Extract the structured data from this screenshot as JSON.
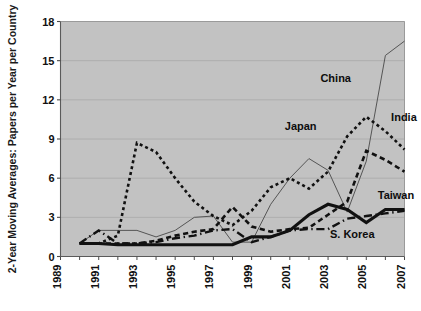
{
  "chart_data": {
    "type": "line",
    "title": "",
    "xlabel": "",
    "ylabel": "2-Year Moving Averages: Papers per Year per Country",
    "xlim": [
      1989,
      2007
    ],
    "ylim": [
      0,
      18
    ],
    "yticks": [
      0,
      3,
      6,
      9,
      12,
      15,
      18
    ],
    "xticks": [
      1989,
      1991,
      1993,
      1995,
      1997,
      1999,
      2001,
      2003,
      2005,
      2007
    ],
    "xtick_labels": [
      "1989",
      "1991",
      "1993",
      "1995",
      "1997",
      "1999",
      "2001",
      "2003",
      "2005",
      "2007"
    ],
    "ytick_labels": [
      "0",
      "3",
      "6",
      "9",
      "12",
      "15",
      "18"
    ],
    "grid": true,
    "grid_axis": "y",
    "legend": "inline-labels",
    "plot_bgcolor": "#c2c2c2",
    "figure_bgcolor": "#ffffff",
    "x": [
      1990,
      1991,
      1992,
      1993,
      1994,
      1995,
      1996,
      1997,
      1998,
      1999,
      2000,
      2001,
      2002,
      2003,
      2004,
      2005,
      2006,
      2007
    ],
    "series": [
      {
        "name": "China",
        "style": "thin-solid",
        "color": "#555555",
        "width": 1,
        "label_x": 2004.2,
        "label_y": 13.4,
        "values": [
          1.0,
          2.0,
          2.0,
          2.0,
          1.5,
          2.0,
          3.0,
          3.1,
          1.1,
          1.1,
          4.0,
          6.0,
          7.5,
          6.6,
          3.4,
          7.3,
          15.4,
          16.5
        ]
      },
      {
        "name": "India",
        "style": "dotted",
        "color": "#111111",
        "width": 2.6,
        "label_x": 2006.3,
        "label_y": 10.4,
        "values": [
          1.0,
          1.0,
          1.6,
          8.7,
          8.0,
          6.0,
          4.2,
          3.1,
          2.4,
          3.5,
          5.3,
          6.0,
          5.2,
          6.5,
          9.2,
          10.7,
          9.6,
          8.2
        ]
      },
      {
        "name": "Japan",
        "style": "thick-dashed",
        "color": "#111111",
        "width": 2.6,
        "label_x": 2002.4,
        "label_y": 9.7,
        "values": [
          1.0,
          1.0,
          1.0,
          1.0,
          1.2,
          1.6,
          1.9,
          2.1,
          3.8,
          2.3,
          1.9,
          2.1,
          2.2,
          3.2,
          4.2,
          8.1,
          7.4,
          6.5
        ]
      },
      {
        "name": "Taiwan",
        "style": "thick-solid",
        "color": "#111111",
        "width": 3.1,
        "label_x": 2005.6,
        "label_y": 4.4,
        "values": [
          1.0,
          1.0,
          0.9,
          0.9,
          0.9,
          0.9,
          0.9,
          0.9,
          0.9,
          1.5,
          1.5,
          2.0,
          3.2,
          4.0,
          3.6,
          2.6,
          3.6,
          3.6
        ]
      },
      {
        "name": "S. Korea",
        "style": "dash-dot",
        "color": "#111111",
        "width": 2.4,
        "label_x": 2003.1,
        "label_y": 1.45,
        "values": [
          1.0,
          2.0,
          1.0,
          1.0,
          1.1,
          1.4,
          1.6,
          2.0,
          2.1,
          1.1,
          1.5,
          2.0,
          2.1,
          2.1,
          2.9,
          3.1,
          3.3,
          3.5
        ]
      }
    ],
    "series_label_anchors": [
      {
        "name": "China",
        "anchor": "end"
      },
      {
        "name": "India",
        "anchor": "start"
      },
      {
        "name": "Japan",
        "anchor": "end"
      },
      {
        "name": "Taiwan",
        "anchor": "start"
      },
      {
        "name": "S. Korea",
        "anchor": "start"
      }
    ]
  }
}
